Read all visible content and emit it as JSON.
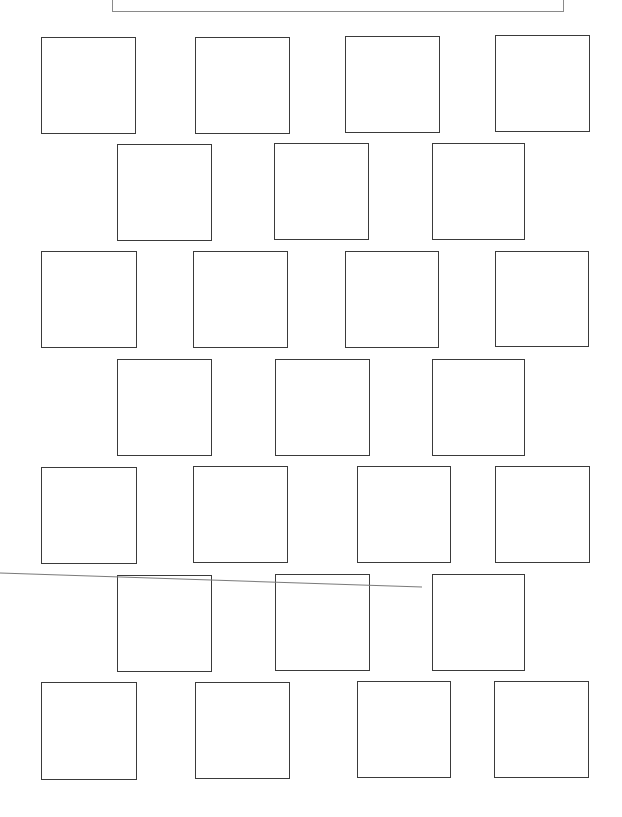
{
  "page": {
    "background": "#ffffff",
    "box_border_color": "#3a3a3a",
    "header_border_color": "#8a8a8a",
    "stray_line_color": "#7a7a7a"
  },
  "header_box": {
    "x": 112,
    "y": -6,
    "w": 452,
    "h": 18,
    "text": ""
  },
  "rows": [
    {
      "boxes": [
        {
          "x": 41,
          "y": 37,
          "w": 95,
          "h": 97
        },
        {
          "x": 195,
          "y": 37,
          "w": 95,
          "h": 97
        },
        {
          "x": 345,
          "y": 36,
          "w": 95,
          "h": 97
        },
        {
          "x": 495,
          "y": 35,
          "w": 95,
          "h": 97
        }
      ]
    },
    {
      "boxes": [
        {
          "x": 117,
          "y": 144,
          "w": 95,
          "h": 97
        },
        {
          "x": 274,
          "y": 143,
          "w": 95,
          "h": 97
        },
        {
          "x": 432,
          "y": 143,
          "w": 93,
          "h": 97
        }
      ]
    },
    {
      "boxes": [
        {
          "x": 41,
          "y": 251,
          "w": 96,
          "h": 97
        },
        {
          "x": 193,
          "y": 251,
          "w": 95,
          "h": 97
        },
        {
          "x": 345,
          "y": 251,
          "w": 94,
          "h": 97
        },
        {
          "x": 495,
          "y": 251,
          "w": 94,
          "h": 96
        }
      ]
    },
    {
      "boxes": [
        {
          "x": 117,
          "y": 359,
          "w": 95,
          "h": 97
        },
        {
          "x": 275,
          "y": 359,
          "w": 95,
          "h": 97
        },
        {
          "x": 432,
          "y": 359,
          "w": 93,
          "h": 97
        }
      ]
    },
    {
      "boxes": [
        {
          "x": 41,
          "y": 467,
          "w": 96,
          "h": 97
        },
        {
          "x": 193,
          "y": 466,
          "w": 95,
          "h": 97
        },
        {
          "x": 357,
          "y": 466,
          "w": 94,
          "h": 97
        },
        {
          "x": 495,
          "y": 466,
          "w": 95,
          "h": 97
        }
      ]
    },
    {
      "boxes": [
        {
          "x": 117,
          "y": 575,
          "w": 95,
          "h": 97
        },
        {
          "x": 275,
          "y": 574,
          "w": 95,
          "h": 97
        },
        {
          "x": 432,
          "y": 574,
          "w": 93,
          "h": 97
        }
      ]
    },
    {
      "boxes": [
        {
          "x": 41,
          "y": 682,
          "w": 96,
          "h": 98
        },
        {
          "x": 195,
          "y": 682,
          "w": 95,
          "h": 97
        },
        {
          "x": 357,
          "y": 681,
          "w": 94,
          "h": 97
        },
        {
          "x": 494,
          "y": 681,
          "w": 95,
          "h": 97
        }
      ]
    }
  ],
  "stray_line": {
    "x1": 0,
    "y1": 573,
    "x2": 422,
    "y2": 587
  }
}
